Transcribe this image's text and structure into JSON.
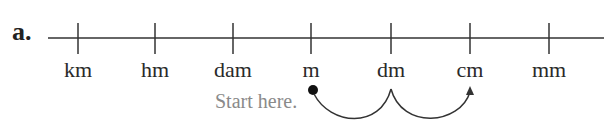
{
  "part_label": "a.",
  "units": [
    {
      "label": "km",
      "x": 78
    },
    {
      "label": "hm",
      "x": 155
    },
    {
      "label": "dam",
      "x": 233
    },
    {
      "label": "m",
      "x": 311
    },
    {
      "label": "dm",
      "x": 391
    },
    {
      "label": "cm",
      "x": 470
    },
    {
      "label": "mm",
      "x": 549
    }
  ],
  "start_text": "Start here.",
  "start_unit": "m",
  "arrow_path": [
    "m",
    "dm",
    "cm"
  ],
  "colors": {
    "line": "#333333",
    "start_text": "#8a8a8a",
    "text": "#2a2a2a"
  }
}
